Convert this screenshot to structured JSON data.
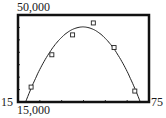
{
  "window": {
    "xmin_label": "15",
    "xmax_label": "75",
    "ymin_label": "15,000",
    "ymax_label": "50,000"
  },
  "chart_data": {
    "type": "scatter",
    "title": "",
    "xlabel": "",
    "ylabel": "",
    "xlim": [
      15,
      75
    ],
    "ylim": [
      15000,
      50000
    ],
    "x_tick_step": 10,
    "y_tick_step": 5000,
    "grid": false,
    "legend": null,
    "series": [
      {
        "name": "data",
        "marker": "square",
        "x": [
          21,
          30.5,
          40,
          49.5,
          59,
          68.5
        ],
        "y": [
          21000,
          34000,
          42000,
          46800,
          36900,
          19400
        ]
      },
      {
        "name": "quadratic fit",
        "kind": "line",
        "vertex": [
          44,
          45200
        ],
        "x_intercepts_at_ymin": [
          18.5,
          71
        ]
      }
    ]
  }
}
